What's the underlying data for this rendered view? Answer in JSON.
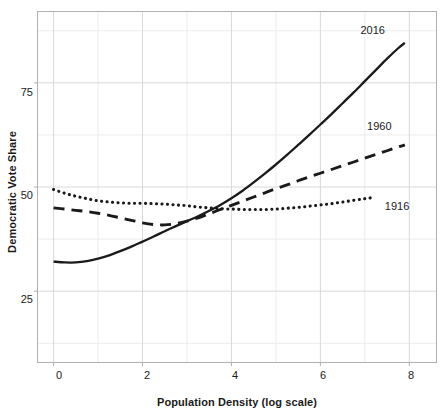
{
  "chart_data": {
    "type": "line",
    "title": "",
    "xlabel": "Population Density (log scale)",
    "ylabel": "Democratic Vote Share",
    "xlim": [
      -0.35,
      8.6
    ],
    "ylim": [
      8,
      92
    ],
    "xticks": [
      0,
      2,
      4,
      6,
      8
    ],
    "xticklabels": [
      "0",
      "2",
      "4",
      "6",
      "8"
    ],
    "yticks": [
      25,
      50,
      75
    ],
    "yticklabels": [
      "25",
      "50",
      "75"
    ],
    "grid": true,
    "grid_minor_y": [
      12.5,
      37.5,
      62.5,
      87.5
    ],
    "grid_minor_x": [
      1,
      3,
      5,
      7
    ],
    "legend_position": "inline-right-annotations",
    "series": [
      {
        "name": "2016",
        "style": "solid",
        "label_x": 6.9,
        "label_y": 87.5,
        "x": [
          0.0,
          0.25,
          0.5,
          0.75,
          1.0,
          1.25,
          1.5,
          1.75,
          2.0,
          2.25,
          2.5,
          2.75,
          3.0,
          3.25,
          3.5,
          3.75,
          4.0,
          4.25,
          4.5,
          4.75,
          5.0,
          5.25,
          5.5,
          5.75,
          6.0,
          6.25,
          6.5,
          6.75,
          7.0,
          7.25,
          7.5,
          7.75,
          7.9
        ],
        "values": [
          32.1,
          31.9,
          31.9,
          32.2,
          32.8,
          33.6,
          34.6,
          35.7,
          36.9,
          38.1,
          39.4,
          40.6,
          41.8,
          43.0,
          44.3,
          45.7,
          47.3,
          49.1,
          51.1,
          53.2,
          55.4,
          57.7,
          60.1,
          62.5,
          65.0,
          67.5,
          70.1,
          72.7,
          75.4,
          78.1,
          80.8,
          83.3,
          84.6
        ]
      },
      {
        "name": "1960",
        "style": "dashed",
        "label_x": 7.05,
        "label_y": 64.5,
        "x": [
          0.0,
          0.25,
          0.5,
          0.75,
          1.0,
          1.25,
          1.5,
          1.75,
          2.0,
          2.25,
          2.5,
          2.75,
          3.0,
          3.25,
          3.5,
          3.75,
          4.0,
          4.25,
          4.5,
          4.75,
          5.0,
          5.25,
          5.5,
          5.75,
          6.0,
          6.25,
          6.5,
          6.75,
          7.0,
          7.25,
          7.5,
          7.75,
          7.9
        ],
        "values": [
          45.0,
          44.7,
          44.4,
          44.1,
          43.7,
          43.2,
          42.6,
          42.0,
          41.4,
          41.0,
          40.9,
          41.2,
          41.8,
          42.6,
          43.6,
          44.6,
          45.6,
          46.6,
          47.6,
          48.6,
          49.6,
          50.5,
          51.5,
          52.4,
          53.3,
          54.2,
          55.1,
          56.0,
          56.9,
          57.8,
          58.7,
          59.6,
          60.1
        ]
      },
      {
        "name": "1916",
        "style": "dotted",
        "label_x": 7.45,
        "label_y": 45.2,
        "x": [
          0.0,
          0.25,
          0.5,
          0.75,
          1.0,
          1.25,
          1.5,
          1.75,
          2.0,
          2.25,
          2.5,
          2.75,
          3.0,
          3.25,
          3.5,
          3.75,
          4.0,
          4.25,
          4.5,
          4.75,
          5.0,
          5.25,
          5.5,
          5.75,
          6.0,
          6.25,
          6.5,
          6.75,
          7.0,
          7.2
        ],
        "values": [
          49.4,
          48.5,
          47.8,
          47.2,
          46.7,
          46.4,
          46.2,
          46.1,
          46.1,
          46.0,
          45.9,
          45.7,
          45.5,
          45.2,
          45.0,
          44.8,
          44.7,
          44.6,
          44.6,
          44.6,
          44.7,
          44.9,
          45.1,
          45.4,
          45.7,
          46.0,
          46.4,
          46.8,
          47.2,
          47.5
        ]
      }
    ]
  },
  "colors": {
    "line": "#1a1a1a",
    "grid_major": "#d9d9d9",
    "grid_minor": "#ececec",
    "border": "#b0b0b0",
    "text": "#1a1a1a",
    "background": "#ffffff"
  }
}
